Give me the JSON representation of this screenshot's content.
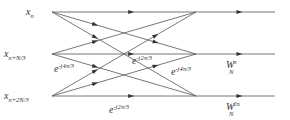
{
  "diagram": {
    "inputs": [
      {
        "base": "x",
        "sub": "n"
      },
      {
        "base": "x",
        "sub": "n+N/3"
      },
      {
        "base": "x",
        "sub": "n+2N/3"
      }
    ],
    "twiddle_labels": [
      {
        "base": "e",
        "sup": "-j4π/3",
        "edge": "input1-to-node2"
      },
      {
        "base": "e",
        "sup": "-j2π/3",
        "edge": "input2-to-node1"
      },
      {
        "base": "e",
        "sup": "-j4π/3",
        "edge": "input1-to-node2-b"
      },
      {
        "base": "e",
        "sup": "-j2π/3",
        "edge": "input2-to-node1-b"
      }
    ],
    "output_labels": [
      {
        "base": "W",
        "sub": "N",
        "sup": "n"
      },
      {
        "base": "W",
        "sub": "N",
        "sup": "2n"
      }
    ],
    "line_color": "#555555",
    "text_color": "#333333"
  }
}
